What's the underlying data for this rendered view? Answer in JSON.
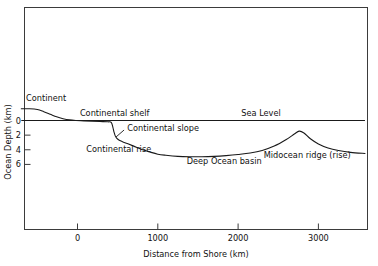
{
  "chart_data": {
    "type": "line",
    "title": "",
    "xlabel": "Distance from Shore (km)",
    "ylabel": "Ocean Depth (km)",
    "xlim": [
      -700,
      3580
    ],
    "ylim": [
      -1.6,
      9.2
    ],
    "y_inverted": true,
    "grid": false,
    "legend": "none",
    "xticks": [
      0,
      1000,
      2000,
      3000
    ],
    "xtick_labels": [
      "0",
      "1000",
      "2000",
      "3000"
    ],
    "yticks": [
      0,
      2,
      4,
      6
    ],
    "ytick_labels": [
      "0",
      "2",
      "4",
      "6"
    ],
    "series": [
      {
        "name": "Ocean floor profile",
        "x": [
          -700,
          -600,
          -500,
          -420,
          -340,
          -260,
          -180,
          -100,
          -20,
          80,
          180,
          280,
          380,
          420,
          440,
          455,
          470,
          490,
          520,
          560,
          620,
          700,
          800,
          900,
          1000,
          1100,
          1250,
          1400,
          1550,
          1700,
          1850,
          2000,
          2150,
          2300,
          2450,
          2600,
          2700,
          2760,
          2820,
          2900,
          3000,
          3120,
          3250,
          3400,
          3580
        ],
        "y": [
          -1.6,
          -1.6,
          -1.5,
          -1.2,
          -0.85,
          -0.5,
          -0.25,
          -0.08,
          0.0,
          0.05,
          0.1,
          0.14,
          0.18,
          0.25,
          0.9,
          1.6,
          2.1,
          2.45,
          2.7,
          2.9,
          3.15,
          3.5,
          3.95,
          4.3,
          4.6,
          4.75,
          4.9,
          4.95,
          4.95,
          4.9,
          4.8,
          4.65,
          4.45,
          4.1,
          3.5,
          2.6,
          1.85,
          1.45,
          1.7,
          2.5,
          3.2,
          3.75,
          4.1,
          4.35,
          4.5
        ]
      },
      {
        "name": "Sea Level",
        "x": [
          -700,
          3580
        ],
        "y": [
          0,
          0
        ]
      }
    ],
    "annotations": [
      {
        "text": "Continent",
        "x": -640,
        "y": -2.6
      },
      {
        "text": "Continental shelf",
        "x": 30,
        "y": -0.55
      },
      {
        "text": "Sea Level",
        "x": 2040,
        "y": -0.55
      },
      {
        "text": "Continental slope",
        "x": 620,
        "y": 1.45
      },
      {
        "text": "Continental rise",
        "x": 110,
        "y": 4.35
      },
      {
        "text": "Deep Ocean basin",
        "x": 1360,
        "y": 5.9
      },
      {
        "text": "Midocean ridge (rise)",
        "x": 2320,
        "y": 5.1
      }
    ],
    "leader_lines": [
      {
        "name": "continental-slope-leader",
        "x1": 480,
        "y1": 2.25,
        "x2": 580,
        "y2": 1.3
      }
    ]
  },
  "figure": {
    "frame_color": "#3b3b3b",
    "curve_color": "#1a1a1a",
    "text_color": "#111111"
  }
}
